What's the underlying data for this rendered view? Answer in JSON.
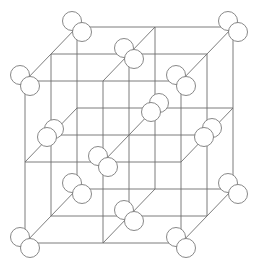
{
  "diagram": {
    "type": "crystal-lattice",
    "grid_divisions": 2,
    "projection": {
      "origin_front_bottom_left": [
        25,
        243
      ],
      "unit_x": [
        78,
        0
      ],
      "unit_y": [
        0,
        -81
      ],
      "unit_z": [
        26,
        -27
      ]
    },
    "colors": {
      "line": "#6e6e6e",
      "atom_fill": "#ffffff",
      "atom_stroke": "#7a7a7a",
      "background": "#ffffff"
    },
    "atom_radius": 9.5,
    "atom_pair_offsets": {
      "back": [
        -5,
        -6
      ],
      "front": [
        5,
        5
      ]
    },
    "sites": [
      {
        "name": "corner-front-bottom-left",
        "grid": [
          0,
          0,
          0
        ]
      },
      {
        "name": "corner-front-bottom-right",
        "grid": [
          2,
          0,
          0
        ]
      },
      {
        "name": "corner-front-top-left",
        "grid": [
          0,
          2,
          0
        ]
      },
      {
        "name": "corner-front-top-right",
        "grid": [
          2,
          2,
          0
        ]
      },
      {
        "name": "corner-back-bottom-left",
        "grid": [
          0,
          0,
          2
        ]
      },
      {
        "name": "corner-back-bottom-right",
        "grid": [
          2,
          0,
          2
        ]
      },
      {
        "name": "corner-back-top-left",
        "grid": [
          0,
          2,
          2
        ]
      },
      {
        "name": "corner-back-top-right",
        "grid": [
          2,
          2,
          2
        ]
      },
      {
        "name": "face-center-front",
        "grid": [
          1,
          1,
          0
        ]
      },
      {
        "name": "face-center-back",
        "grid": [
          1,
          1,
          2
        ],
        "pair_offsets": {
          "back": [
            4,
            -5
          ],
          "front": [
            -4,
            4
          ]
        }
      },
      {
        "name": "face-center-top",
        "grid": [
          1,
          2,
          1
        ]
      },
      {
        "name": "face-center-bottom",
        "grid": [
          1,
          0,
          1
        ]
      },
      {
        "name": "face-center-left",
        "grid": [
          0,
          1,
          1
        ],
        "pair_offsets": {
          "back": [
            3,
            -6
          ],
          "front": [
            -4,
            2
          ]
        }
      },
      {
        "name": "face-center-right",
        "grid": [
          2,
          1,
          1
        ],
        "pair_offsets": {
          "back": [
            5,
            -7
          ],
          "front": [
            -3,
            2
          ]
        }
      }
    ]
  }
}
